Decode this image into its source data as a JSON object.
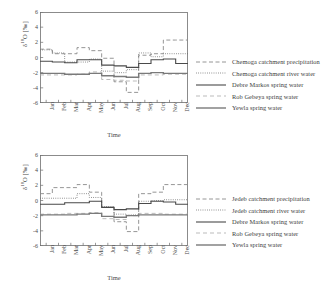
{
  "figures": [
    {
      "id": "top",
      "chart_data": {
        "type": "line",
        "title": "",
        "xlabel": "Time",
        "ylabel": "δ¹⁸O [‰]",
        "ylim": [
          -6,
          6
        ],
        "yticks": [
          6,
          4,
          2,
          0,
          -2,
          -4,
          -6
        ],
        "categories": [
          "Jan",
          "Feb",
          "Mar",
          "Apr",
          "May",
          "Jun",
          "Jul",
          "Aug",
          "Sep",
          "Oct",
          "Nov",
          "Dec"
        ],
        "grid": false,
        "legend_position": "right",
        "step": true,
        "series": [
          {
            "name": "Chemoga catchment precipitation",
            "style": "dashed",
            "color": "#8a8a8a",
            "values": [
              1.1,
              0.5,
              0.5,
              1.3,
              0.9,
              -0.1,
              -3.2,
              -4.6,
              0.3,
              0.5,
              2.3,
              2.3
            ]
          },
          {
            "name": "Chemoga catchment river water",
            "style": "dotted",
            "color": "#6b6b6b",
            "values": [
              1.0,
              0.6,
              -0.6,
              -0.6,
              -0.2,
              -1.8,
              -2.0,
              -1.6,
              0.6,
              0.1,
              0.5,
              0.5
            ]
          },
          {
            "name": "Debre Markos spring water",
            "style": "solid",
            "color": "#4a4a4a",
            "values": [
              -0.5,
              -0.6,
              -0.7,
              -0.3,
              -0.3,
              -1.0,
              -1.1,
              -1.3,
              -0.8,
              -0.3,
              -0.2,
              -0.8
            ]
          },
          {
            "name": "Rob Gebeya spring water",
            "style": "dashed-light",
            "color": "#a9a9a9",
            "values": [
              -2.3,
              -2.3,
              -2.3,
              -2.2,
              -1.9,
              -2.9,
              -3.0,
              -3.1,
              -2.3,
              -2.3,
              -2.2,
              -2.2
            ]
          },
          {
            "name": "Yewla spring water",
            "style": "solid-thick",
            "color": "#7a7a7a",
            "values": [
              -2.1,
              -2.1,
              -2.2,
              -2.2,
              -2.1,
              -2.4,
              -2.5,
              -2.6,
              -2.1,
              -2.0,
              -2.1,
              -2.1
            ]
          }
        ]
      }
    },
    {
      "id": "bottom",
      "chart_data": {
        "type": "line",
        "title": "",
        "xlabel": "Time",
        "ylabel": "δ¹⁸O [‰]",
        "ylim": [
          -6,
          6
        ],
        "yticks": [
          6,
          4,
          2,
          0,
          -2,
          -4,
          -6
        ],
        "categories": [
          "Jan",
          "Feb",
          "Mar",
          "Apr",
          "May",
          "Jun",
          "Jul",
          "Aug",
          "Sep",
          "Oct",
          "Nov",
          "Dec"
        ],
        "grid": false,
        "legend_position": "right",
        "step": true,
        "series": [
          {
            "name": "Jedeb catchment precipitation",
            "style": "dashed",
            "color": "#8a8a8a",
            "values": [
              0.9,
              1.7,
              1.7,
              2.1,
              1.1,
              -0.9,
              -2.8,
              -4.1,
              0.9,
              1.1,
              2.1,
              2.1
            ]
          },
          {
            "name": "Jedeb catchment river water",
            "style": "dotted",
            "color": "#6b6b6b",
            "values": [
              0.3,
              0.3,
              0.3,
              0.9,
              0.4,
              -0.8,
              -1.8,
              -1.9,
              -0.1,
              0.0,
              0.1,
              0.1
            ]
          },
          {
            "name": "Debre Markos spring water",
            "style": "solid",
            "color": "#4a4a4a",
            "values": [
              -0.5,
              -0.5,
              -0.3,
              -0.3,
              -0.1,
              -0.9,
              -1.2,
              -1.1,
              -0.4,
              -0.1,
              -0.2,
              -0.5
            ]
          },
          {
            "name": "Rob Gebeya spring water",
            "style": "dashed-light",
            "color": "#a9a9a9",
            "values": [
              -1.8,
              -1.8,
              -1.7,
              -1.7,
              -1.6,
              -2.4,
              -2.5,
              -2.0,
              -1.7,
              -1.7,
              -1.8,
              -1.8
            ]
          },
          {
            "name": "Yewla spring water",
            "style": "solid-thick",
            "color": "#7a7a7a",
            "values": [
              -1.9,
              -1.9,
              -1.9,
              -1.8,
              -1.7,
              -2.1,
              -2.2,
              -2.0,
              -1.9,
              -1.9,
              -1.9,
              -1.9
            ]
          }
        ]
      }
    }
  ]
}
